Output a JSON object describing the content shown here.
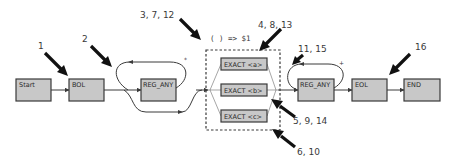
{
  "diagram": {
    "type": "regex-node-graph",
    "nodes": [
      {
        "id": "start",
        "label": "Start"
      },
      {
        "id": "bol",
        "label": "BOL"
      },
      {
        "id": "reg_any_1",
        "label": "REG_ANY",
        "quantifier": "*"
      },
      {
        "id": "exact_a",
        "label": "EXACT <a>"
      },
      {
        "id": "exact_b",
        "label": "EXACT <b>"
      },
      {
        "id": "exact_c",
        "label": "EXACT <c>"
      },
      {
        "id": "reg_any_2",
        "label": "REG_ANY",
        "quantifier": "+"
      },
      {
        "id": "eol",
        "label": "EOL"
      },
      {
        "id": "end",
        "label": "END"
      }
    ],
    "group": {
      "label": "( ) => $1",
      "members": [
        "exact_a",
        "exact_b",
        "exact_c"
      ]
    },
    "quantifiers": {
      "star": "*",
      "plus": "+"
    },
    "step_labels": [
      {
        "id": "s1",
        "text": "1",
        "target": "bol"
      },
      {
        "id": "s2",
        "text": "2",
        "target": "reg_any_1"
      },
      {
        "id": "s3",
        "text": "3, 7, 12",
        "target": "group"
      },
      {
        "id": "s4",
        "text": "4, 8, 13",
        "target": "exact_a"
      },
      {
        "id": "s5",
        "text": "5, 9, 14",
        "target": "exact_b"
      },
      {
        "id": "s6",
        "text": "6, 10",
        "target": "exact_c"
      },
      {
        "id": "s11",
        "text": "11, 15",
        "target": "reg_any_2"
      },
      {
        "id": "s16",
        "text": "16",
        "target": "eol"
      }
    ]
  }
}
